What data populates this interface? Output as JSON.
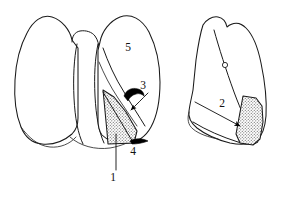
{
  "figure": {
    "background_color": "#ffffff",
    "ink_color": "#1a1a1a",
    "stipple_color": "#8e8e8e",
    "views": [
      {
        "name": "anterior-view-both-lungs",
        "description": "Anterior view of both lungs with mediastinum",
        "position": "left"
      },
      {
        "name": "lateral-view-right-lung",
        "description": "Lateral view of right lung",
        "position": "right"
      }
    ],
    "shaded_regions": [
      {
        "name": "shaded-segment-anterior",
        "view": "anterior-view-both-lungs",
        "fill": "stipple"
      },
      {
        "name": "shaded-segment-lateral",
        "view": "lateral-view-right-lung",
        "fill": "stipple"
      }
    ],
    "labels": [
      {
        "id": "label-1",
        "text": "1",
        "x": 113,
        "y": 178,
        "pointer": "vertical-leader-line",
        "view": "anterior-view-both-lungs"
      },
      {
        "id": "label-2",
        "text": "2",
        "x": 222,
        "y": 104,
        "pointer": "diagonal-arrow",
        "view": "lateral-view-right-lung"
      },
      {
        "id": "label-3",
        "text": "3",
        "x": 143,
        "y": 86,
        "pointer": "curved-arrow",
        "view": "anterior-view-both-lungs"
      },
      {
        "id": "label-4",
        "text": "4",
        "x": 133,
        "y": 152,
        "pointer": "solid-wedge-mark",
        "view": "anterior-view-both-lungs"
      },
      {
        "id": "label-5",
        "text": "5",
        "x": 128,
        "y": 48,
        "pointer": "none",
        "view": "anterior-view-both-lungs"
      }
    ],
    "markers": [
      {
        "name": "fissure-marker-circle",
        "x": 225,
        "y": 65,
        "r": 2.6,
        "view": "lateral-view-right-lung"
      }
    ]
  }
}
